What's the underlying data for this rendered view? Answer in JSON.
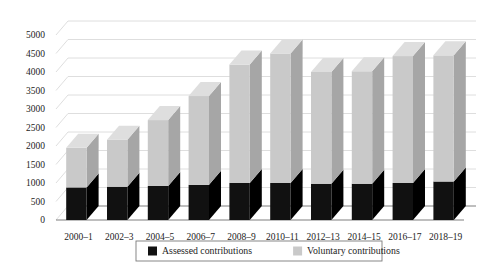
{
  "chart_data": {
    "type": "bar",
    "subtype": "stacked-3d-column",
    "title": "",
    "xlabel": "",
    "ylabel": "",
    "ylim": [
      0,
      5000
    ],
    "ytick_step": 500,
    "ytick_labels": [
      "5000",
      "4500",
      "4000",
      "3500",
      "3000",
      "2500",
      "2000",
      "1500",
      "1000",
      "500",
      "0"
    ],
    "grid": true,
    "grid_orientation": "horizontal-slanted-3d",
    "legend_position": "bottom-center",
    "categories": [
      "2000–1",
      "2002–3",
      "2004–5",
      "2006–7",
      "2008–9",
      "2010–11",
      "2012–13",
      "2014–15",
      "2016–17",
      "2018–19"
    ],
    "series": [
      {
        "name": "Assessed contributions",
        "color": "#111111",
        "values": [
          880,
          900,
          920,
          950,
          1000,
          1000,
          980,
          980,
          1000,
          1040
        ]
      },
      {
        "name": "Voluntary contributions",
        "color": "#c9c9c9",
        "values": [
          1070,
          1270,
          1780,
          2400,
          3200,
          3500,
          3020,
          3040,
          3430,
          3410
        ]
      }
    ],
    "totals": [
      1950,
      2170,
      2700,
      3350,
      4200,
      4500,
      4000,
      4020,
      4430,
      4450
    ]
  },
  "legend": {
    "items": [
      {
        "label": "Assessed contributions",
        "swatch_color": "#111111"
      },
      {
        "label": "Voluntary contributions",
        "swatch_color": "#c9c9c9"
      }
    ]
  },
  "style": {
    "background": "#ffffff",
    "grid_color": "#d5d5d5",
    "axis_color": "#707070",
    "bar_front_dark": "#111111",
    "bar_front_light": "#c9c9c9",
    "bar_side_dark": "#000000",
    "bar_side_light": "#a6a6a6",
    "bar_top_light": "#dedede",
    "text_color": "#1c1c1c"
  }
}
